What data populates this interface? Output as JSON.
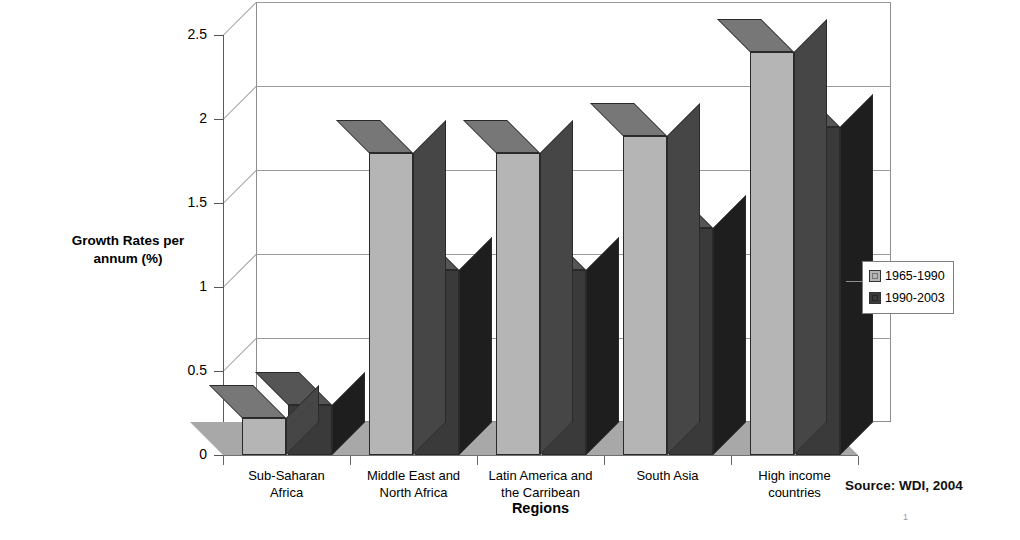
{
  "chart_data": {
    "type": "bar",
    "title": "",
    "subtitle": "",
    "xlabel": "Regions",
    "ylabel": "Growth Rates per\nannum (%)",
    "categories": [
      "Sub-Saharan\nAfrica",
      "Middle East and\nNorth Africa",
      "Latin America and\nthe Carribean",
      "South Asia",
      "High income\ncountries"
    ],
    "series": [
      {
        "name": "1965-1990",
        "color": "#b5b5b5",
        "values": [
          0.22,
          1.8,
          1.8,
          1.9,
          2.4
        ]
      },
      {
        "name": "1990-2003",
        "color": "#3a3a3a",
        "values": [
          0.3,
          1.1,
          1.1,
          1.35,
          1.95
        ]
      }
    ],
    "ylim": [
      0,
      2.5
    ],
    "yticks": [
      "0",
      "0.5",
      "1",
      "1.5",
      "2",
      "2.5"
    ],
    "ytick_values": [
      0,
      0.5,
      1,
      1.5,
      2,
      2.5
    ],
    "grid": true,
    "legend_position": "right",
    "three_d": true
  },
  "notes": {
    "source": "Source:  WDI, 2004",
    "page_number": "1"
  }
}
